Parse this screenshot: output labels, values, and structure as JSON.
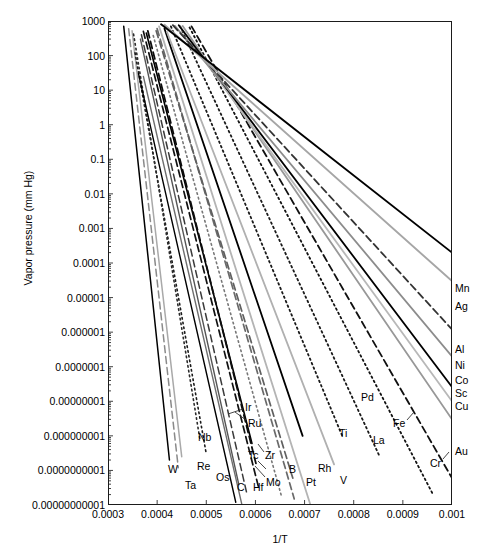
{
  "chart_data": {
    "type": "line",
    "title": "",
    "xlabel": "1/T",
    "ylabel": "Vapor pressure (mm Hg)",
    "yscale": "log",
    "xlim": [
      0.0003,
      0.001
    ],
    "ylim": [
      1e-11,
      1000
    ],
    "grid": false,
    "legend_position": "inline-endpoint-labels",
    "xticks": [
      "0.0003",
      "0.0004",
      "0.0005",
      "0.0006",
      "0.0007",
      "0.0008",
      "0.0009",
      "0.001"
    ],
    "xtick_values": [
      0.0003,
      0.0004,
      0.0005,
      0.0006,
      0.0007,
      0.0008,
      0.0009,
      0.001
    ],
    "yticks": [
      "1000",
      "100",
      "10",
      "1",
      "0.1",
      "0.01",
      "0.001",
      "0.0001",
      "0.00001",
      "0.000001",
      "0.0000001",
      "0.00000001",
      "0.000000001",
      "0.0000000001",
      "0.00000000001"
    ],
    "ytick_values": [
      1000,
      100,
      10,
      1,
      0.1,
      0.01,
      0.001,
      0.0001,
      1e-05,
      1e-06,
      1e-07,
      1e-08,
      1e-09,
      1e-10,
      1e-11
    ],
    "note": "Each series is a straight line on log(p) vs 1/T (Clausius-Clapeyron). Endpoints given as [x1,y1,x2,y2] with y in mm Hg.",
    "series": [
      {
        "name": "W",
        "color": "#000000",
        "style": "solid",
        "width": 1.5,
        "points": [
          [
            0.000332,
            700
          ],
          [
            0.000425,
            2e-10
          ]
        ]
      },
      {
        "name": "Ta",
        "color": "#8a8a8a",
        "style": "dashed",
        "width": 1.5,
        "points": [
          [
            0.000342,
            600
          ],
          [
            0.000443,
            1.2e-10
          ]
        ]
      },
      {
        "name": "Re",
        "color": "#a9a9a9",
        "style": "solid",
        "width": 1.5,
        "points": [
          [
            0.000349,
            520
          ],
          [
            0.00045,
            2.5e-10
          ]
        ]
      },
      {
        "name": "Os",
        "color": "#1b1b1b",
        "style": "dotted",
        "width": 1.6,
        "points": [
          [
            0.000355,
            120
          ],
          [
            0.0005,
            3e-10
          ]
        ]
      },
      {
        "name": "Nb",
        "color": "#2b2b2b",
        "style": "dotted",
        "width": 1.6,
        "points": [
          [
            0.000352,
            420
          ],
          [
            0.000487,
            8e-10
          ]
        ]
      },
      {
        "name": "C",
        "color": "#000000",
        "style": "solid",
        "width": 1.4,
        "points": [
          [
            0.000362,
            30
          ],
          [
            0.00056,
            1.2e-11
          ]
        ]
      },
      {
        "name": "Hf",
        "color": "#6e6e6e",
        "style": "solid",
        "width": 1.4,
        "points": [
          [
            0.000372,
            25
          ],
          [
            0.000572,
            1.1e-11
          ]
        ]
      },
      {
        "name": "Mo",
        "color": "#3a3a3a",
        "style": "dashed",
        "width": 1.5,
        "points": [
          [
            0.000368,
            400
          ],
          [
            0.000583,
            2e-11
          ]
        ]
      },
      {
        "name": "Tc",
        "color": "#555555",
        "style": "solid",
        "width": 1.4,
        "points": [
          [
            0.000366,
            300
          ],
          [
            0.000566,
            4e-11
          ]
        ]
      },
      {
        "name": "Zr",
        "color": "#111111",
        "style": "dashed",
        "width": 1.7,
        "points": [
          [
            0.000372,
            500
          ],
          [
            0.000607,
            3e-11
          ]
        ]
      },
      {
        "name": "Ir",
        "color": "#000000",
        "style": "solid",
        "width": 1.6,
        "points": [
          [
            0.000378,
            450
          ],
          [
            0.000593,
            6e-10
          ]
        ]
      },
      {
        "name": "Ru",
        "color": "#0d0d0d",
        "style": "dashed",
        "width": 1.8,
        "points": [
          [
            0.000381,
            520
          ],
          [
            0.000601,
            1.6e-10
          ]
        ]
      },
      {
        "name": "B",
        "color": "#777777",
        "style": "dotted",
        "width": 1.6,
        "points": [
          [
            0.000392,
            380
          ],
          [
            0.000653,
            1.8e-11
          ]
        ]
      },
      {
        "name": "Pt",
        "color": "#6a6a6a",
        "style": "dashed",
        "width": 1.7,
        "points": [
          [
            0.0004,
            600
          ],
          [
            0.000679,
            1.5e-11
          ]
        ]
      },
      {
        "name": "Rh",
        "color": "#606060",
        "style": "dashed",
        "width": 1.7,
        "points": [
          [
            0.000398,
            520
          ],
          [
            0.000676,
            6e-11
          ]
        ]
      },
      {
        "name": "V",
        "color": "#b4b4b4",
        "style": "solid",
        "width": 1.8,
        "points": [
          [
            0.000404,
            700
          ],
          [
            0.000712,
            1e-11
          ]
        ]
      },
      {
        "name": "Ti",
        "color": "#000000",
        "style": "solid",
        "width": 1.8,
        "points": [
          [
            0.000415,
            600
          ],
          [
            0.000696,
            1e-09
          ]
        ]
      },
      {
        "name": "La",
        "color": "#b0b0b0",
        "style": "solid",
        "width": 1.8,
        "points": [
          [
            0.00042,
            480
          ],
          [
            0.00076,
            1.5e-10
          ]
        ]
      },
      {
        "name": "Pd",
        "color": "#1a1a1a",
        "style": "dotted",
        "width": 1.8,
        "points": [
          [
            0.000428,
            700
          ],
          [
            0.000778,
            9e-10
          ]
        ]
      },
      {
        "name": "Fe",
        "color": "#1a1a1a",
        "style": "dotted",
        "width": 1.8,
        "points": [
          [
            0.000447,
            700
          ],
          [
            0.000853,
            2.5e-10
          ]
        ]
      },
      {
        "name": "Cr",
        "color": "#121212",
        "style": "dotted",
        "width": 1.8,
        "points": [
          [
            0.000466,
            650
          ],
          [
            0.00096,
            2.2e-11
          ]
        ]
      },
      {
        "name": "Au",
        "color": "#101010",
        "style": "dashed",
        "width": 1.8,
        "points": [
          [
            0.00047,
            700
          ],
          [
            0.001,
            6e-11
          ]
        ]
      },
      {
        "name": "Cu",
        "color": "#989898",
        "style": "solid",
        "width": 1.8,
        "points": [
          [
            0.000452,
            720
          ],
          [
            0.001,
            3e-09
          ]
        ]
      },
      {
        "name": "Sc",
        "color": "#b8b8b8",
        "style": "solid",
        "width": 1.8,
        "points": [
          [
            0.000446,
            700
          ],
          [
            0.001,
            1e-08
          ]
        ]
      },
      {
        "name": "Co",
        "color": "#000000",
        "style": "solid",
        "width": 1.8,
        "points": [
          [
            0.000444,
            750
          ],
          [
            0.001,
            2.6e-08
          ]
        ]
      },
      {
        "name": "Ni",
        "color": "#8c8c8c",
        "style": "solid",
        "width": 1.8,
        "points": [
          [
            0.000436,
            720
          ],
          [
            0.001,
            2e-07
          ]
        ]
      },
      {
        "name": "Al",
        "color": "#333333",
        "style": "dashed",
        "width": 1.8,
        "points": [
          [
            0.000432,
            760
          ],
          [
            0.001,
            1.2e-06
          ]
        ]
      },
      {
        "name": "Ag",
        "color": "#a6a6a6",
        "style": "solid",
        "width": 1.9,
        "points": [
          [
            0.000415,
            780
          ],
          [
            0.001,
            3e-05
          ]
        ]
      },
      {
        "name": "Mn",
        "color": "#000000",
        "style": "solid",
        "width": 1.9,
        "points": [
          [
            0.000408,
            800
          ],
          [
            0.001,
            0.0002
          ]
        ]
      }
    ],
    "endpoint_labels_right": [
      "Mn",
      "Ag",
      "Al",
      "Ni",
      "Co",
      "Sc",
      "Cu",
      "Au"
    ],
    "endpoint_labels_bottom": [
      "W",
      "Ta",
      "Re",
      "Nb",
      "Os",
      "C",
      "Hf",
      "Tc",
      "Mo",
      "Zr",
      "Ir",
      "Ru",
      "B",
      "Pt",
      "Rh",
      "V",
      "Ti",
      "La",
      "Pd",
      "Fe",
      "Cr"
    ]
  },
  "annotations": [
    {
      "text": "Mn",
      "x": 455,
      "y": 289,
      "leader": null
    },
    {
      "text": "Ag",
      "x": 455,
      "y": 307,
      "leader": null
    },
    {
      "text": "Al",
      "x": 455,
      "y": 350,
      "leader": null
    },
    {
      "text": "Ni",
      "x": 455,
      "y": 366,
      "leader": null
    },
    {
      "text": "Co",
      "x": 455,
      "y": 381,
      "leader": null
    },
    {
      "text": "Sc",
      "x": 455,
      "y": 394,
      "leader": null
    },
    {
      "text": "Cu",
      "x": 455,
      "y": 407,
      "leader": null
    },
    {
      "text": "Au",
      "x": 455,
      "y": 452,
      "leader": null
    },
    {
      "text": "Cr",
      "x": 430,
      "y": 464,
      "leader": [
        443,
        459,
        449,
        452
      ]
    },
    {
      "text": "Fe",
      "x": 393,
      "y": 424,
      "leader": [
        407,
        420,
        414,
        412
      ]
    },
    {
      "text": "Pd",
      "x": 361,
      "y": 398,
      "leader": null
    },
    {
      "text": "La",
      "x": 373,
      "y": 441,
      "leader": null
    },
    {
      "text": "Ti",
      "x": 339,
      "y": 434,
      "leader": null
    },
    {
      "text": "V",
      "x": 340,
      "y": 481,
      "leader": null
    },
    {
      "text": "Rh",
      "x": 318,
      "y": 469,
      "leader": null
    },
    {
      "text": "Pt",
      "x": 306,
      "y": 483,
      "leader": null
    },
    {
      "text": "B",
      "x": 289,
      "y": 470,
      "leader": null
    },
    {
      "text": "Zr",
      "x": 265,
      "y": 456,
      "leader": [
        264,
        452,
        258,
        444
      ]
    },
    {
      "text": "Mo",
      "x": 266,
      "y": 483,
      "leader": [
        265,
        477,
        255,
        466
      ]
    },
    {
      "text": "Tc",
      "x": 248,
      "y": 456,
      "leader": [
        258,
        461,
        266,
        469
      ]
    },
    {
      "text": "Hf",
      "x": 253,
      "y": 488,
      "leader": null
    },
    {
      "text": "C",
      "x": 237,
      "y": 488,
      "leader": null
    },
    {
      "text": "Os",
      "x": 216,
      "y": 478,
      "leader": null
    },
    {
      "text": "Ru",
      "x": 248,
      "y": 424,
      "leader": [
        246,
        420,
        235,
        412
      ]
    },
    {
      "text": "Ir",
      "x": 245,
      "y": 408,
      "leader": [
        243,
        409,
        228,
        414
      ]
    },
    {
      "text": "Nb",
      "x": 198,
      "y": 438,
      "leader": null
    },
    {
      "text": "Re",
      "x": 197,
      "y": 467,
      "leader": null
    },
    {
      "text": "Ta",
      "x": 185,
      "y": 486,
      "leader": null
    },
    {
      "text": "W",
      "x": 168,
      "y": 470,
      "leader": null
    }
  ]
}
